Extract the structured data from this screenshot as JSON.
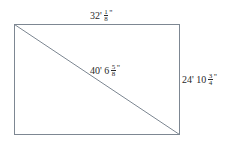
{
  "diagram": {
    "shape": "rectangle-with-diagonal",
    "line_color": "#7d8792",
    "text_color": "#2a2a2a",
    "labels": {
      "top_width": {
        "whole": "32'",
        "frac_num": "1",
        "frac_den": "8",
        "unit": "\""
      },
      "diagonal": {
        "whole": "40' 6",
        "frac_num": "5",
        "frac_den": "8",
        "unit": "\""
      },
      "right_height": {
        "whole": "24' 10",
        "frac_num": "3",
        "frac_den": "4",
        "unit": "\""
      }
    }
  }
}
